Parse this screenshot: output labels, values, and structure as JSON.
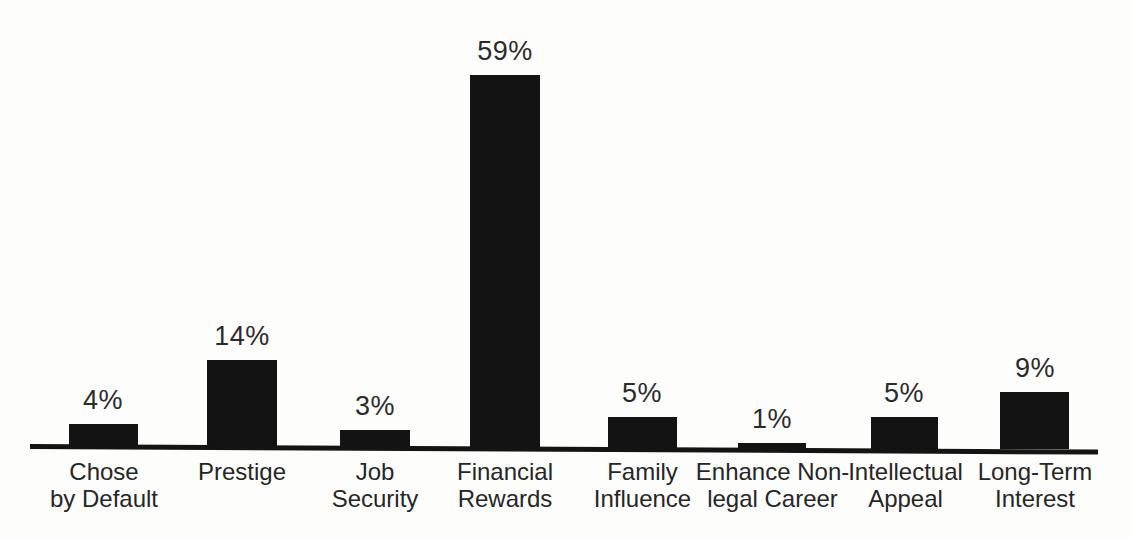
{
  "chart_data": {
    "type": "bar",
    "title": "",
    "subtitle": "",
    "xlabel": "",
    "ylabel": "",
    "ylim": [
      0,
      59
    ],
    "grid": false,
    "legend": false,
    "value_suffix": "%",
    "orientation": "vertical",
    "bar_color": "#131313",
    "background_color": "#fdfdfc",
    "axis_color": "#141414",
    "categories": [
      "Chose by Default",
      "Prestige",
      "Job Security",
      "Financial Rewards",
      "Family Influence",
      "Enhance Non-legal Career",
      "Intellectual Appeal",
      "Long-Term Interest"
    ],
    "values": [
      4,
      14,
      3,
      59,
      5,
      1,
      5,
      9
    ],
    "bars": [
      {
        "category": "Chose by Default",
        "label_line1": "Chose",
        "label_line2": "by Default",
        "value": 4,
        "value_label": "4%"
      },
      {
        "category": "Prestige",
        "label_line1": "Prestige",
        "label_line2": "",
        "value": 14,
        "value_label": "14%"
      },
      {
        "category": "Job Security",
        "label_line1": "Job",
        "label_line2": "Security",
        "value": 3,
        "value_label": "3%"
      },
      {
        "category": "Financial Rewards",
        "label_line1": "Financial",
        "label_line2": "Rewards",
        "value": 59,
        "value_label": "59%"
      },
      {
        "category": "Family Influence",
        "label_line1": "Family",
        "label_line2": "Influence",
        "value": 5,
        "value_label": "5%"
      },
      {
        "category": "Enhance Non-legal Career",
        "label_line1": "Enhance Non-",
        "label_line2": "legal Career",
        "value": 1,
        "value_label": "1%"
      },
      {
        "category": "Intellectual Appeal",
        "label_line1": "Intellectual",
        "label_line2": "Appeal",
        "value": 5,
        "value_label": "5%"
      },
      {
        "category": "Long-Term Interest",
        "label_line1": "Long-Term",
        "label_line2": "Interest",
        "value": 9,
        "value_label": "9%"
      }
    ]
  }
}
